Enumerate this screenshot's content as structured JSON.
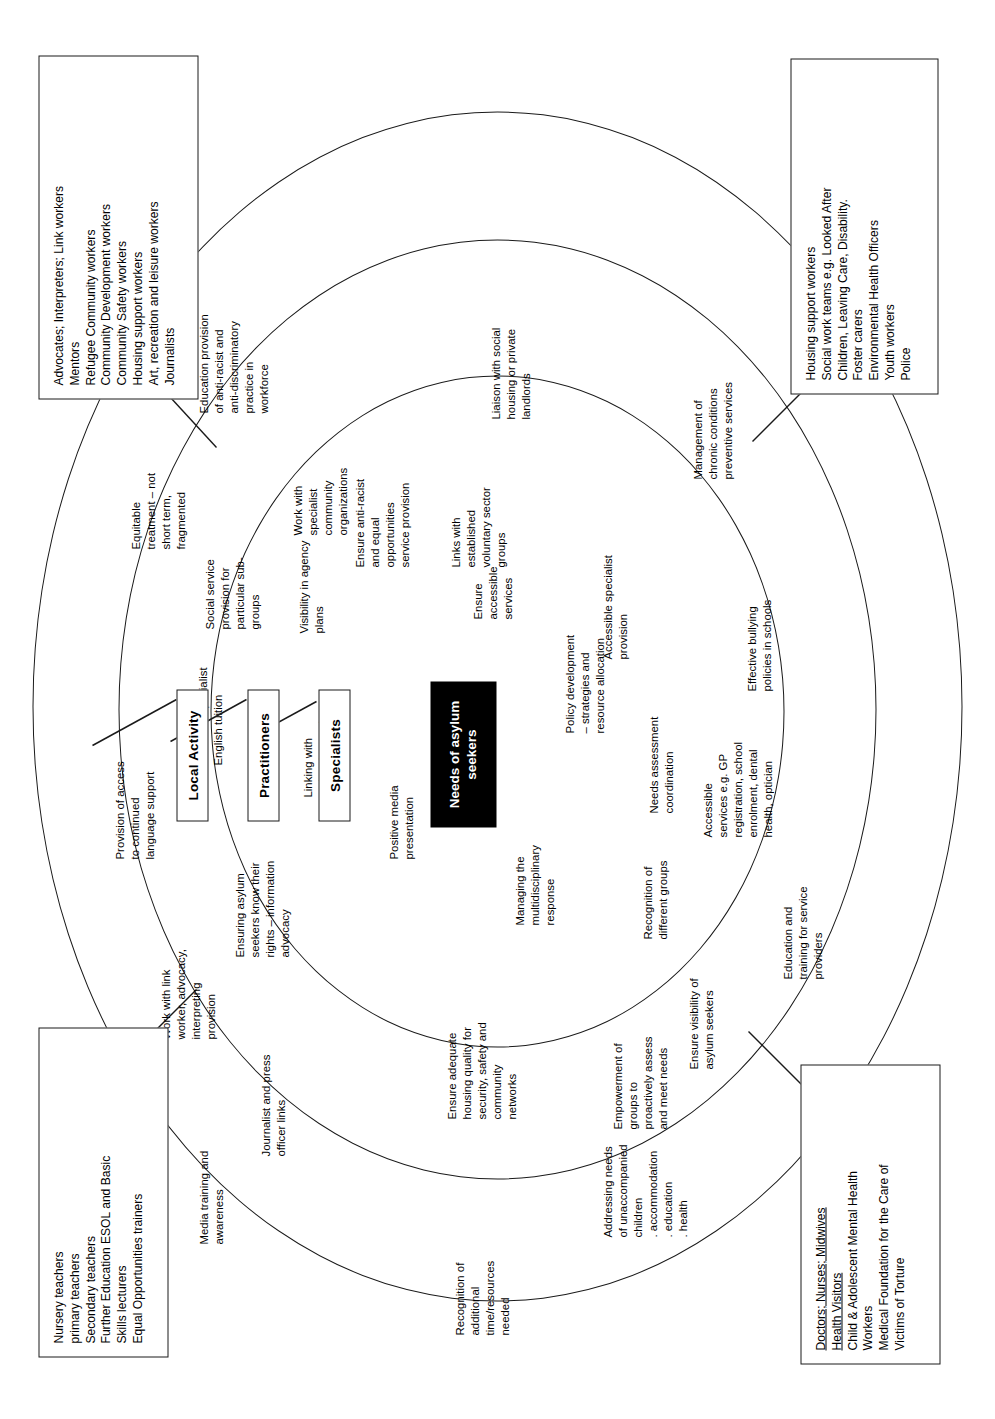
{
  "diagram": {
    "title": "Needs of asylum seekers",
    "center_label": "Needs of asylum\nseekers",
    "ring_labels": {
      "outer": "Local Activity",
      "middle": "Practitioners",
      "inner": "Specialists"
    },
    "colors": {
      "center_fill": "#000000",
      "center_text": "#ffffff",
      "stroke": "#1a1a1a",
      "page_background": "#ffffff"
    }
  },
  "corner_boxes": [
    {
      "id": "education",
      "name": "education-roles-box",
      "lines": [
        {
          "text": "Nursery teachers",
          "underline": false
        },
        {
          "text": "primary teachers",
          "underline": false
        },
        {
          "text": "Secondary teachers",
          "underline": false
        },
        {
          "text": "Further Education ESOL and Basic",
          "underline": false
        },
        {
          "text": "Skills lecturers",
          "underline": false
        },
        {
          "text": "Equal Opportunities trainers",
          "underline": false
        }
      ]
    },
    {
      "id": "community",
      "name": "community-roles-box",
      "lines": [
        {
          "text": "Advocates; Interpreters; Link workers",
          "underline": false
        },
        {
          "text": "Mentors",
          "underline": false
        },
        {
          "text": "Refugee Community workers",
          "underline": false
        },
        {
          "text": "Community Development workers",
          "underline": false
        },
        {
          "text": "Community Safety workers",
          "underline": false
        },
        {
          "text": "Housing support workers",
          "underline": false
        },
        {
          "text": "Art, recreation and leisure workers",
          "underline": false
        },
        {
          "text": "Journalists",
          "underline": false
        }
      ]
    },
    {
      "id": "health",
      "name": "health-roles-box",
      "lines": [
        {
          "text": "Doctors; Nurses; Midwives",
          "underline": true
        },
        {
          "text": "Health Visitors",
          "underline": true
        },
        {
          "text": "Child & Adolescent Mental Health",
          "underline": false
        },
        {
          "text": "Workers",
          "underline": false
        },
        {
          "text": "Medical Foundation for the Care of",
          "underline": false
        },
        {
          "text": "Victims of Torture",
          "underline": false
        }
      ]
    },
    {
      "id": "social",
      "name": "social-roles-box",
      "lines": [
        {
          "text": "Housing support workers",
          "underline": false
        },
        {
          "text": "Social work teams e.g. Looked After",
          "underline": false
        },
        {
          "text": "Children, Leaving Care, Disability.",
          "underline": false
        },
        {
          "text": "Foster carers",
          "underline": false
        },
        {
          "text": "Environmental Health Officers",
          "underline": false
        },
        {
          "text": "Youth workers",
          "underline": false
        },
        {
          "text": "Police",
          "underline": false
        }
      ]
    }
  ],
  "nodes": {
    "n01": "Media training and\nawareness",
    "n02": "Recognition of\nadditional\ntime/resources\nneeded",
    "n03": "Addressing needs\nof unaccompanied\nchildren\n.  accommodation\n.  education\n.  health",
    "n04": "Journalist and press\nofficer links",
    "n05": "Work with link\nworker, advocacy,\ninterpreting\nprovision",
    "n06": "Provision of access\nto continued\nlanguage support",
    "n07": "Equitable\ntreatment – not\nshort term,\nfragmented",
    "n08": "Education provision\nof anti-racist and\nanti-discriminatory\npractice in\nworkforce",
    "n09": "Liaison with social\nhousing or private\nlandlords",
    "n10": "Management of\nchronic conditions\npreventive services",
    "n11": "Effective bullying\npolicies in schools",
    "n12": "Education and\ntraining for service\nproviders",
    "n13": "Ensure visibility of\nasylum seekers",
    "n14": "Empowerment of\ngroups to\nproactively assess\nand meet needs",
    "n15": "Ensure adequate\nhousing quality for\nsecurity, safety and\ncommunity\nnetworks",
    "n16": "Ensuring asylum\nseekers know their\nrights – information\nadvocacy",
    "n17": "Provision and\naccess to specialist\nEnglish tuition",
    "n18": "Social service\nprovision for\nparticular sub-\ngroups",
    "n19": "Work with\nspecialist\ncommunity\norganizations",
    "n20": "Links with\nestablished\nvoluntary sector\ngroups",
    "n21": "Accessible specialist\nprovision",
    "n22": "Accessible\nservices e.g. GP\nregistration, school\nenrolment, dental\nhealth, optician",
    "n23": "Recognition of\ndifferent groups",
    "n24": "Managing the\nmultidisciplinary\nresponse",
    "n25": "Positive media\npresentation",
    "n26": "Linking with\nnational agencies",
    "n27": "Visibility in agency\nplans",
    "n28": "Ensure anti-racist\nand equal\nopportunities\nservice provision",
    "n29": "Ensure\naccessible\nservices",
    "n30": "Policy development\n– strategies and\nresource allocation",
    "n31": "Needs assessment\ncoordination"
  }
}
